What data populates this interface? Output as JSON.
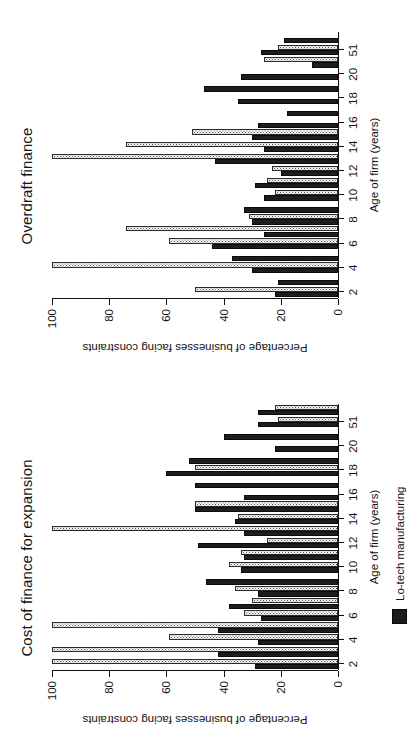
{
  "figure": {
    "background_color": "#ffffff",
    "rotation": "90 degrees counter-clockwise",
    "lo_tech_color": "#1d1d1d",
    "hi_tech_color": "#fbfbfb"
  },
  "legend": {
    "lo_tech_label": "Lo-tech manufacturing",
    "hi_tech_label": "Hi-tech manufacturing",
    "lo_tech_swatch": "filled-black-square",
    "hi_tech_swatch": "stippled-dotted-square"
  },
  "axes": {
    "ylabel": "Percentage of businesses facing constraints",
    "xlabel": "Age of firm (years)",
    "yticks": [
      0,
      20,
      40,
      60,
      80,
      100
    ],
    "ytick_labels": [
      "0",
      "20",
      "40",
      "60",
      "80",
      "100"
    ],
    "ylim": [
      0,
      100
    ],
    "xtick_labels": [
      "2",
      "4",
      "6",
      "8",
      "10",
      "12",
      "14",
      "16",
      "18",
      "20",
      "51"
    ]
  },
  "chart_data": [
    {
      "type": "bar",
      "id": "cost-of-finance-for-expansion",
      "title": "Cost of finance for expansion",
      "xlabel": "Age of firm (years)",
      "ylabel": "Percentage of businesses facing constraints",
      "ylim": [
        0,
        100
      ],
      "grid": false,
      "legend_position": "bottom",
      "categories": [
        "1",
        "2",
        "3",
        "4",
        "5",
        "6",
        "7",
        "8",
        "9",
        "10",
        "11",
        "12",
        "13",
        "14",
        "15",
        "16",
        "17",
        "18",
        "19",
        "20",
        "51"
      ],
      "tick_categories": [
        "2",
        "4",
        "6",
        "8",
        "10",
        "12",
        "14",
        "16",
        "18",
        "20",
        "51"
      ],
      "series": [
        {
          "name": "Lo-tech manufacturing",
          "fill": "solid-black",
          "values": [
            29,
            42,
            28,
            42,
            27,
            38,
            28,
            46,
            34,
            33,
            49,
            33,
            36,
            50,
            33,
            50,
            60,
            52,
            22,
            40,
            28,
            28
          ]
        },
        {
          "name": "Hi-tech manufacturing",
          "fill": "stipple",
          "values": [
            100,
            100,
            59,
            100,
            33,
            30,
            36,
            0,
            38,
            34,
            25,
            100,
            35,
            50,
            0,
            0,
            50,
            0,
            0,
            0,
            21,
            22
          ]
        }
      ]
    },
    {
      "type": "bar",
      "id": "overdraft-finance",
      "title": "Overdraft finance",
      "xlabel": "Age of firm (years)",
      "ylabel": "Percentage of businesses facing constraints",
      "ylim": [
        0,
        100
      ],
      "grid": false,
      "legend_position": "bottom",
      "categories": [
        "1",
        "2",
        "3",
        "4",
        "5",
        "6",
        "7",
        "8",
        "9",
        "10",
        "11",
        "12",
        "13",
        "14",
        "15",
        "16",
        "17",
        "18",
        "19",
        "20",
        "51"
      ],
      "tick_categories": [
        "2",
        "4",
        "6",
        "8",
        "10",
        "12",
        "14",
        "16",
        "18",
        "20",
        "51"
      ],
      "series": [
        {
          "name": "Lo-tech manufacturing",
          "fill": "solid-black",
          "values": [
            22,
            21,
            30,
            37,
            44,
            26,
            30,
            33,
            26,
            29,
            20,
            43,
            26,
            30,
            28,
            18,
            35,
            47,
            34,
            9,
            27,
            19
          ]
        },
        {
          "name": "Hi-tech manufacturing",
          "fill": "stipple",
          "values": [
            50,
            0,
            100,
            0,
            59,
            74,
            31,
            0,
            22,
            25,
            23,
            100,
            74,
            51,
            0,
            0,
            0,
            0,
            0,
            26,
            21,
            0
          ]
        }
      ]
    }
  ]
}
